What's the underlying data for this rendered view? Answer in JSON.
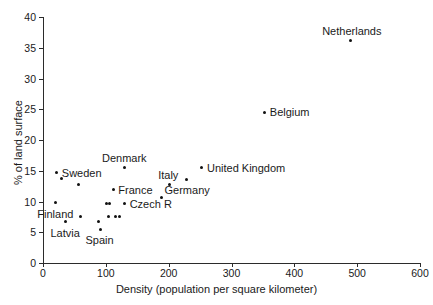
{
  "chart_data": {
    "type": "scatter",
    "title": "",
    "xlabel": "Density (population per square kilometer)",
    "ylabel": "% of land surface",
    "xlim": [
      0,
      600
    ],
    "ylim": [
      0,
      40
    ],
    "xticks": [
      0,
      100,
      200,
      300,
      400,
      500,
      600
    ],
    "yticks": [
      0,
      5,
      10,
      15,
      20,
      25,
      30,
      35,
      40
    ],
    "grid": false,
    "legend": null,
    "points": [
      {
        "x": 20,
        "y": 9.8,
        "label": "Finland",
        "label_pos": "below"
      },
      {
        "x": 22,
        "y": 14.7,
        "label": "Sweden",
        "label_pos": "right"
      },
      {
        "x": 30,
        "y": 13.8,
        "label": null
      },
      {
        "x": 36,
        "y": 6.7,
        "label": "Latvia",
        "label_pos": "below"
      },
      {
        "x": 57,
        "y": 12.8,
        "label": null
      },
      {
        "x": 60,
        "y": 7.6,
        "label": null
      },
      {
        "x": 88,
        "y": 6.8,
        "label": null
      },
      {
        "x": 91,
        "y": 5.5,
        "label": "Spain",
        "label_pos": "below"
      },
      {
        "x": 101,
        "y": 9.7,
        "label": null
      },
      {
        "x": 106,
        "y": 9.7,
        "label": null
      },
      {
        "x": 104,
        "y": 7.6,
        "label": null
      },
      {
        "x": 112,
        "y": 11.9,
        "label": "France",
        "label_pos": "right"
      },
      {
        "x": 115,
        "y": 7.6,
        "label": null
      },
      {
        "x": 122,
        "y": 7.6,
        "label": null
      },
      {
        "x": 129,
        "y": 15.5,
        "label": "Denmark",
        "label_pos": "above"
      },
      {
        "x": 130,
        "y": 9.6,
        "label": "Czech R",
        "label_pos": "right"
      },
      {
        "x": 188,
        "y": 10.6,
        "label": null
      },
      {
        "x": 201,
        "y": 12.7,
        "label": "Italy",
        "label_pos": "above"
      },
      {
        "x": 229,
        "y": 13.6,
        "label": "Germany",
        "label_pos": "below"
      },
      {
        "x": 253,
        "y": 15.5,
        "label": "United Kingdom",
        "label_pos": "right"
      },
      {
        "x": 353,
        "y": 24.5,
        "label": "Belgium",
        "label_pos": "right"
      },
      {
        "x": 490,
        "y": 36.1,
        "label": "Netherlands",
        "label_pos": "above"
      }
    ]
  }
}
